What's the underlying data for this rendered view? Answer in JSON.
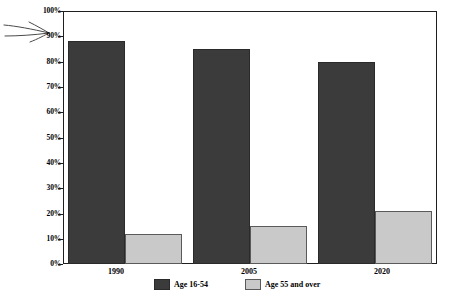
{
  "chart_data": {
    "type": "bar",
    "title": "",
    "xlabel": "",
    "ylabel": "Percentage of Total Labor Force",
    "categories": [
      "1990",
      "2005",
      "2020"
    ],
    "series": [
      {
        "name": "Age 16-54",
        "values": [
          88,
          85,
          80
        ],
        "color": "#3b3b3b"
      },
      {
        "name": "Age 55 and over",
        "values": [
          12,
          15,
          21
        ],
        "color": "#c9c9c9"
      }
    ],
    "ylim": [
      0,
      100
    ],
    "ytick_labels": [
      "100%",
      "90%",
      "80%",
      "70%",
      "60%",
      "50%",
      "40%",
      "30%",
      "20%",
      "10%",
      "0%"
    ],
    "ytick_values": [
      100,
      90,
      80,
      70,
      60,
      50,
      40,
      30,
      20,
      10,
      0
    ],
    "grid": false,
    "legend_position": "bottom",
    "annotations": [
      {
        "name": "hand-drawn-arrow",
        "points_to": "90%"
      }
    ]
  },
  "axis": {
    "y_title": "Percentage of Total Labor Force"
  },
  "legend": {
    "entries": [
      {
        "label": "Age 16-54"
      },
      {
        "label": "Age 55 and over"
      }
    ]
  }
}
